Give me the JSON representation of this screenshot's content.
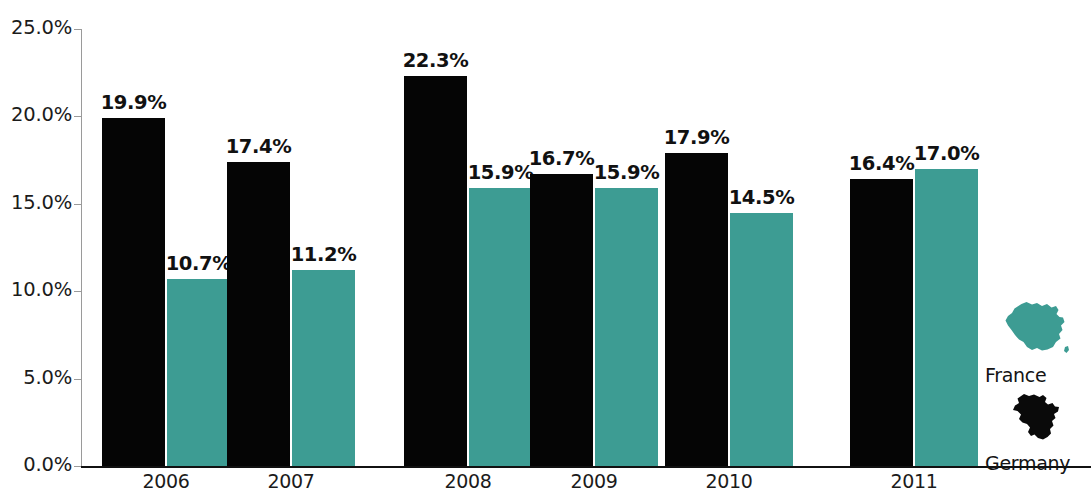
{
  "chart_data": {
    "type": "bar",
    "title": "",
    "subtitle": "",
    "xlabel": "",
    "ylabel": "",
    "categories": [
      "2006",
      "2007",
      "2008",
      "2009",
      "2010",
      "2011"
    ],
    "series": [
      {
        "name": "Germany",
        "color": "#050505",
        "values": [
          19.9,
          17.4,
          22.3,
          16.7,
          17.9,
          16.4
        ],
        "value_labels": [
          "19.9%",
          "17.4%",
          "22.3%",
          "16.7%",
          "17.9%",
          "16.4%"
        ]
      },
      {
        "name": "France",
        "color": "#3d9c93",
        "values": [
          10.7,
          11.2,
          15.9,
          15.9,
          14.5,
          17.0
        ],
        "value_labels": [
          "10.7%",
          "11.2%",
          "15.9%",
          "15.9%",
          "14.5%",
          "17.0%"
        ]
      }
    ],
    "ylim": [
      0,
      25
    ],
    "ytick_values": [
      0,
      5,
      10,
      15,
      20,
      25
    ],
    "ytick_labels": [
      "0.0%",
      "5.0%",
      "10.0%",
      "15.0%",
      "20.0%",
      "25.0%"
    ],
    "grid": false,
    "legend_position": "right"
  },
  "legend": {
    "entries": [
      {
        "label": "France",
        "color": "#3d9c93",
        "icon": "france-map-icon"
      },
      {
        "label": "Germany",
        "color": "#0a0a0a",
        "icon": "germany-map-icon"
      }
    ]
  }
}
